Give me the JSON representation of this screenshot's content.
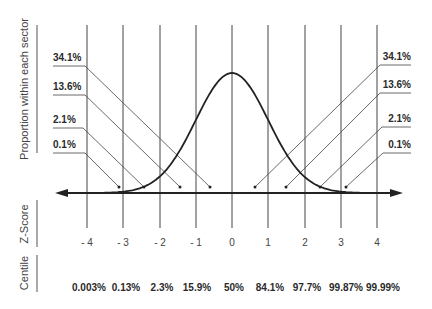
{
  "chart_data": {
    "type": "line",
    "title": "",
    "ylabel": "Proportion within each sector",
    "row_labels": {
      "zscore": "Z-Score",
      "centile": "Centile"
    },
    "x": [
      -4,
      -3,
      -2,
      -1,
      0,
      1,
      2,
      3,
      4
    ],
    "z_tick_labels": [
      "- 4",
      "- 3",
      "- 2",
      "- 1",
      "0",
      "1",
      "2",
      "3",
      "4"
    ],
    "centiles": [
      "0.003%",
      "0.13%",
      "2.3%",
      "15.9%",
      "50%",
      "84.1%",
      "97.7%",
      "99.87%",
      "99.99%"
    ],
    "sector_proportions": {
      "left": [
        "34.1%",
        "13.6%",
        "2.1%",
        "0.1%"
      ],
      "right": [
        "34.1%",
        "13.6%",
        "2.1%",
        "0.1%"
      ]
    },
    "xlim": [
      -4,
      4
    ],
    "grid": true,
    "legend": null
  }
}
